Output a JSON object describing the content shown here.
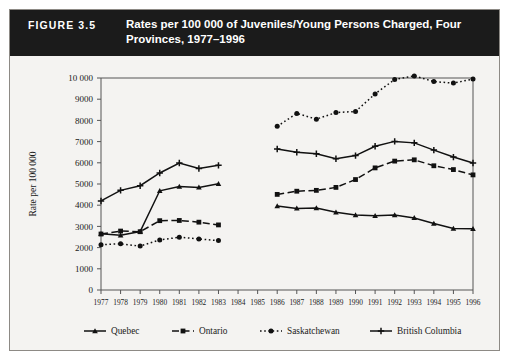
{
  "figure": {
    "number": "FIGURE 3.5",
    "title": "Rates per 100 000 of Juveniles/Young Persons Charged, Four Provinces, 1977–1996"
  },
  "chart_data": {
    "type": "line",
    "title": "Rates per 100 000 of Juveniles/Young Persons Charged, Four Provinces, 1977–1996",
    "xlabel": "",
    "ylabel": "Rate per 100 000",
    "ylim": [
      0,
      10000
    ],
    "ytick_labels": [
      "0",
      "1000",
      "2000",
      "3000",
      "4000",
      "5000",
      "6000",
      "7000",
      "8000",
      "9000",
      "10 000"
    ],
    "ytick_values": [
      0,
      1000,
      2000,
      3000,
      4000,
      5000,
      6000,
      7000,
      8000,
      9000,
      10000
    ],
    "grid": false,
    "legend_position": "bottom",
    "data_gap_years": [
      1984,
      1985
    ],
    "categories": [
      1977,
      1978,
      1979,
      1980,
      1981,
      1982,
      1983,
      1984,
      1985,
      1986,
      1987,
      1988,
      1989,
      1990,
      1991,
      1992,
      1993,
      1994,
      1995,
      1996
    ],
    "x": [
      "1977",
      "1978",
      "1979",
      "1980",
      "1981",
      "1982",
      "1983",
      "1984",
      "1985",
      "1986",
      "1987",
      "1988",
      "1989",
      "1990",
      "1991",
      "1992",
      "1993",
      "1994",
      "1995",
      "1996"
    ],
    "series": [
      {
        "name": "Quebec",
        "line_style": "solid",
        "marker": "triangle",
        "color": "#111111",
        "values": [
          2650,
          2580,
          2760,
          4680,
          4880,
          4840,
          5010,
          null,
          null,
          3960,
          3850,
          3870,
          3670,
          3540,
          3500,
          3540,
          3400,
          3140,
          2900,
          2890
        ]
      },
      {
        "name": "Ontario",
        "line_style": "dashed",
        "marker": "square",
        "color": "#111111",
        "values": [
          2640,
          2780,
          2750,
          3270,
          3280,
          3200,
          3070,
          null,
          null,
          4510,
          4660,
          4700,
          4840,
          5210,
          5760,
          6080,
          6140,
          5860,
          5680,
          5430
        ]
      },
      {
        "name": "Saskatchewan",
        "line_style": "dotted",
        "marker": "circle",
        "color": "#111111",
        "values": [
          2140,
          2180,
          2070,
          2360,
          2490,
          2410,
          2330,
          null,
          null,
          7720,
          8330,
          8060,
          8370,
          8420,
          9250,
          9930,
          10100,
          9830,
          9760,
          9950
        ]
      },
      {
        "name": "British Columbia",
        "line_style": "solid",
        "marker": "plus",
        "color": "#111111",
        "values": [
          4200,
          4700,
          4920,
          5520,
          5990,
          5730,
          5880,
          null,
          null,
          6650,
          6500,
          6430,
          6190,
          6340,
          6780,
          7010,
          6940,
          6600,
          6270,
          5990
        ]
      }
    ]
  },
  "legend": {
    "items": [
      {
        "label": "Quebec"
      },
      {
        "label": "Ontario"
      },
      {
        "label": "Saskatchewan"
      },
      {
        "label": "British Columbia"
      }
    ]
  }
}
